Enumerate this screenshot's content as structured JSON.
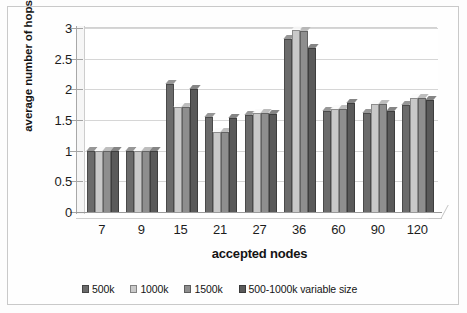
{
  "figure": {
    "background": "#fdfdfd",
    "frame_color": "#c9c9c9"
  },
  "axis": {
    "y_title": "average number of hops",
    "x_title": "accepted nodes",
    "y_ticks": [
      "0",
      "0.5",
      "1",
      "1.5",
      "2",
      "2.5",
      "3"
    ]
  },
  "legend": {
    "items": [
      {
        "label": "500k",
        "color": "#6b6b6b"
      },
      {
        "label": "1000k",
        "color": "#c9c9c9"
      },
      {
        "label": "1500k",
        "color": "#8e8e8e"
      },
      {
        "label": "500-1000k variable size",
        "color": "#5a5a5a"
      }
    ]
  },
  "chart_data": {
    "type": "bar",
    "title": "",
    "subtitle": "",
    "xlabel": "accepted nodes",
    "ylabel": "average number of hops",
    "ylim": [
      0,
      3
    ],
    "ytick_step": 0.5,
    "grid": true,
    "legend_position": "bottom",
    "categories": [
      "7",
      "9",
      "15",
      "21",
      "27",
      "36",
      "60",
      "90",
      "120"
    ],
    "series": [
      {
        "name": "500k",
        "color": "#6b6b6b",
        "values": [
          1.0,
          1.0,
          2.09,
          1.55,
          1.58,
          2.82,
          1.65,
          1.62,
          1.75
        ]
      },
      {
        "name": "1000k",
        "color": "#c9c9c9",
        "values": [
          1.0,
          1.0,
          1.72,
          1.3,
          1.62,
          2.97,
          1.68,
          1.76,
          1.86
        ]
      },
      {
        "name": "1500k",
        "color": "#8e8e8e",
        "values": [
          1.0,
          1.0,
          1.72,
          1.3,
          1.62,
          2.95,
          1.68,
          1.76,
          1.86
        ]
      },
      {
        "name": "500-1000k variable size",
        "color": "#5a5a5a",
        "values": [
          1.0,
          1.0,
          2.0,
          1.54,
          1.6,
          2.67,
          1.77,
          1.64,
          1.83
        ]
      }
    ]
  }
}
